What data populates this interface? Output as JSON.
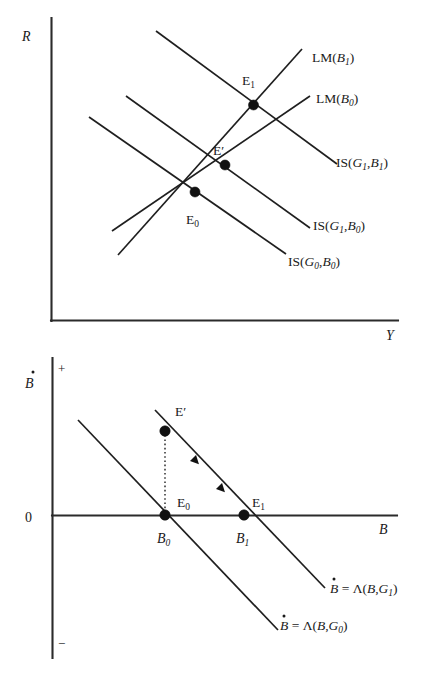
{
  "figure": {
    "type": "economics-diagram",
    "background_color": "#ffffff",
    "line_color": "#1f1f1f",
    "axis_color": "#2b2b2b"
  },
  "top_panel": {
    "name": "IS-LM diagram",
    "y_axis_label": "R",
    "x_axis_label": "Y",
    "curves": [
      {
        "id": "lm-b1",
        "label_main": "LM",
        "label_arg": "B",
        "label_sub": "1",
        "slope": "upward"
      },
      {
        "id": "lm-b0",
        "label_main": "LM",
        "label_arg": "B",
        "label_sub": "0",
        "slope": "upward"
      },
      {
        "id": "is-g1b1",
        "label_main": "IS",
        "arg1": "G",
        "sub1": "1",
        "arg2": "B",
        "sub2": "1",
        "slope": "downward"
      },
      {
        "id": "is-g1b0",
        "label_main": "IS",
        "arg1": "G",
        "sub1": "1",
        "arg2": "B",
        "sub2": "0",
        "slope": "downward"
      },
      {
        "id": "is-g0b0",
        "label_main": "IS",
        "arg1": "G",
        "sub1": "0",
        "arg2": "B",
        "sub2": "0",
        "slope": "downward"
      }
    ],
    "equilibria": [
      {
        "id": "E1",
        "label_main": "E",
        "label_sub": "1"
      },
      {
        "id": "Eprime",
        "label_main": "E",
        "label_sub": "′"
      },
      {
        "id": "E0",
        "label_main": "E",
        "label_sub": "0"
      }
    ]
  },
  "bottom_panel": {
    "name": "Bond accumulation dynamics",
    "y_axis_label": "B",
    "y_axis_dot": true,
    "x_axis_label": "B",
    "positive_sign": "+",
    "negative_sign": "−",
    "origin_label": "0",
    "curves": [
      {
        "id": "bdot-g1",
        "lhs": "B",
        "eq": "=",
        "fn": "Λ",
        "arg1": "B",
        "arg2": "G",
        "sub2": "1"
      },
      {
        "id": "bdot-g0",
        "lhs": "B",
        "eq": "=",
        "fn": "Λ",
        "arg1": "B",
        "arg2": "G",
        "sub2": "0"
      }
    ],
    "equilibria": [
      {
        "id": "Eprime",
        "label_main": "E",
        "label_sub": "′"
      },
      {
        "id": "E0",
        "label_main": "E",
        "label_sub": "0"
      },
      {
        "id": "E1",
        "label_main": "E",
        "label_sub": "1"
      }
    ],
    "axis_ticks": [
      {
        "id": "B0",
        "label_main": "B",
        "label_sub": "0"
      },
      {
        "id": "B1",
        "label_main": "B",
        "label_sub": "1"
      }
    ],
    "adjustment_arrows": 2
  }
}
